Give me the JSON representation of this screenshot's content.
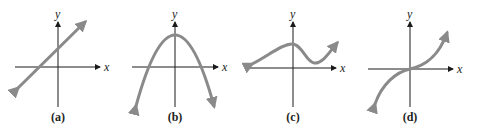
{
  "figure": {
    "axis_label_x": "x",
    "axis_label_y": "y",
    "curve_color": "#8a8a8a",
    "axis_color": "#1a1a1a",
    "panels": [
      {
        "caption": "(a)",
        "shape": "straight line with positive slope"
      },
      {
        "caption": "(b)",
        "shape": "downward-opening parabola"
      },
      {
        "caption": "(c)",
        "shape": "wavy curve with local max near y-axis and local min to the right"
      },
      {
        "caption": "(d)",
        "shape": "cubic-like curve through origin, increasing"
      }
    ]
  }
}
